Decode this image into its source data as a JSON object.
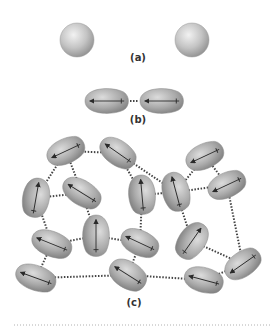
{
  "figure": {
    "panels": [
      {
        "id": "a",
        "label": "(a)",
        "description": "two nonpolar spherical atoms, no interaction"
      },
      {
        "id": "b",
        "label": "(b)",
        "description": "two instantaneous dipoles attracting"
      },
      {
        "id": "c",
        "label": "(c)",
        "description": "network of induced dipoles linked by dispersion forces"
      }
    ],
    "colors": {
      "molecule_fill": "#a8a8a8",
      "molecule_highlight": "#e6e6e6",
      "arrow": "#2a2a2a",
      "dotted_link": "#444444",
      "divider": "#b0b0b0"
    }
  },
  "panel_a": {
    "label": "(a)",
    "atoms": [
      {
        "cx": 77,
        "cy": 40,
        "r": 17
      },
      {
        "cx": 192,
        "cy": 40,
        "r": 17
      }
    ]
  },
  "panel_b": {
    "label": "(b)",
    "molecules": [
      {
        "cx": 107,
        "cy": 101,
        "rx": 22,
        "ry": 13,
        "angle": 0
      },
      {
        "cx": 162,
        "cy": 101,
        "rx": 22,
        "ry": 13,
        "angle": 0
      }
    ]
  },
  "panel_c": {
    "label": "(c)",
    "molecules": [
      {
        "cx": 66,
        "cy": 151,
        "rx": 20,
        "ry": 13,
        "angle": -25
      },
      {
        "cx": 118,
        "cy": 153,
        "rx": 20,
        "ry": 13,
        "angle": 35
      },
      {
        "cx": 36,
        "cy": 198,
        "rx": 14,
        "ry": 20,
        "angle": 10
      },
      {
        "cx": 82,
        "cy": 193,
        "rx": 21,
        "ry": 13,
        "angle": 32
      },
      {
        "cx": 96,
        "cy": 236,
        "rx": 14,
        "ry": 21,
        "angle": 0
      },
      {
        "cx": 52,
        "cy": 244,
        "rx": 21,
        "ry": 13,
        "angle": 22
      },
      {
        "cx": 36,
        "cy": 278,
        "rx": 21,
        "ry": 13,
        "angle": 20
      },
      {
        "cx": 128,
        "cy": 275,
        "rx": 20,
        "ry": 14,
        "angle": 32
      },
      {
        "cx": 140,
        "cy": 243,
        "rx": 20,
        "ry": 13,
        "angle": 25
      },
      {
        "cx": 142,
        "cy": 195,
        "rx": 14,
        "ry": 20,
        "angle": -5
      },
      {
        "cx": 176,
        "cy": 192,
        "rx": 14,
        "ry": 20,
        "angle": -15
      },
      {
        "cx": 205,
        "cy": 156,
        "rx": 20,
        "ry": 13,
        "angle": -25
      },
      {
        "cx": 227,
        "cy": 185,
        "rx": 20,
        "ry": 13,
        "angle": -25
      },
      {
        "cx": 192,
        "cy": 241,
        "rx": 14,
        "ry": 20,
        "angle": 35
      },
      {
        "cx": 243,
        "cy": 264,
        "rx": 20,
        "ry": 13,
        "angle": -35
      },
      {
        "cx": 204,
        "cy": 280,
        "rx": 20,
        "ry": 13,
        "angle": 15
      }
    ],
    "links": [
      [
        1,
        2
      ],
      [
        1,
        3
      ],
      [
        1,
        4
      ],
      [
        2,
        10
      ],
      [
        4,
        3
      ],
      [
        4,
        5
      ],
      [
        3,
        6
      ],
      [
        5,
        6
      ],
      [
        5,
        9
      ],
      [
        6,
        7
      ],
      [
        7,
        8
      ],
      [
        8,
        9
      ],
      [
        9,
        10
      ],
      [
        10,
        11
      ],
      [
        11,
        12
      ],
      [
        12,
        13
      ],
      [
        11,
        13
      ],
      [
        11,
        14
      ],
      [
        14,
        15
      ],
      [
        15,
        16
      ],
      [
        16,
        8
      ],
      [
        13,
        15
      ],
      [
        2,
        11
      ]
    ]
  },
  "divider": {
    "y": 325,
    "x1": 14,
    "x2": 270
  }
}
